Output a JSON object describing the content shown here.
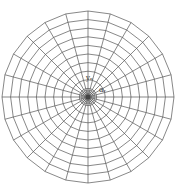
{
  "diagram": {
    "type": "polar-mesh",
    "center": [
      88,
      97
    ],
    "radius": 86,
    "radial_lines": 24,
    "outer_rings": 10,
    "inner_dense_rings": 4,
    "line_color": "#555555",
    "stroke_width": 0.7,
    "labels": {
      "top": "yₙ",
      "right": "αᵣ"
    }
  }
}
